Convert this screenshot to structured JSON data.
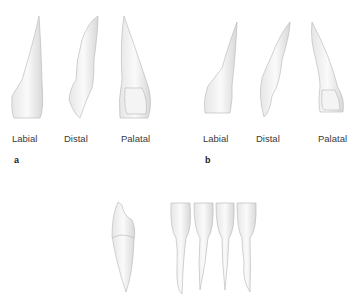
{
  "figure": {
    "panels": [
      {
        "id": "a",
        "label": "a",
        "views": [
          {
            "label": "Labial"
          },
          {
            "label": "Distal"
          },
          {
            "label": "Palatal"
          }
        ]
      },
      {
        "id": "b",
        "label": "b",
        "views": [
          {
            "label": "Labial"
          },
          {
            "label": "Distal"
          },
          {
            "label": "Palatal"
          }
        ]
      },
      {
        "id": "c",
        "label": "",
        "views": []
      }
    ]
  }
}
